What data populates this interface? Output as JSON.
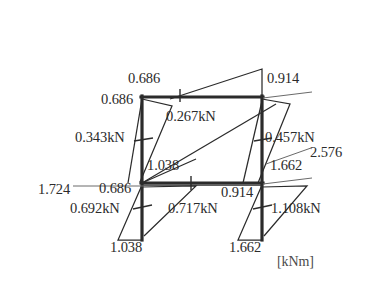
{
  "figure": {
    "type": "bending-moment-diagram",
    "unit_label": "[kNm]",
    "frame": {
      "description": "single-bay two-storey rigid frame",
      "left_column_x": 142,
      "right_column_x": 262,
      "top_beam_y": 97,
      "mid_beam_y": 183,
      "base_y": 240
    },
    "moment_labels": [
      {
        "id": "top-beam-left-top",
        "text": "0.686",
        "x": 128,
        "y": 78
      },
      {
        "id": "top-left-joint",
        "text": "0.686",
        "x": 103,
        "y": 99
      },
      {
        "id": "top-beam-right-top",
        "text": "0.914",
        "x": 267,
        "y": 78
      },
      {
        "id": "mid-beam-left",
        "text": "1.038",
        "x": 147,
        "y": 165
      },
      {
        "id": "mid-beam-right",
        "text": "1.662",
        "x": 272,
        "y": 165
      },
      {
        "id": "mid-left-joint",
        "text": "0.686",
        "x": 98,
        "y": 189
      },
      {
        "id": "mid-beam-right-bottom",
        "text": "0.914",
        "x": 221,
        "y": 190
      },
      {
        "id": "leader-left-2",
        "text": "1.724",
        "x": 42,
        "y": 190
      },
      {
        "id": "leader-right-2",
        "text": "2.576",
        "x": 313,
        "y": 152
      },
      {
        "id": "base-left",
        "text": "1.038",
        "x": 111,
        "y": 245
      },
      {
        "id": "base-right",
        "text": "1.662",
        "x": 229,
        "y": 245
      }
    ],
    "shear_labels": [
      {
        "id": "top-beam-shear",
        "text": "0.267kN",
        "x": 167,
        "y": 116
      },
      {
        "id": "upper-left-column-shear",
        "text": "0.343kN",
        "x": 78,
        "y": 136
      },
      {
        "id": "upper-right-column-shear",
        "text": "0.457kN",
        "x": 265,
        "y": 136
      },
      {
        "id": "lower-left-column-shear",
        "text": "0.692kN",
        "x": 72,
        "y": 207
      },
      {
        "id": "mid-beam-shear",
        "text": "0.717kN",
        "x": 170,
        "y": 207
      },
      {
        "id": "lower-right-column-shear",
        "text": "1.108kN",
        "x": 272,
        "y": 207
      }
    ]
  }
}
